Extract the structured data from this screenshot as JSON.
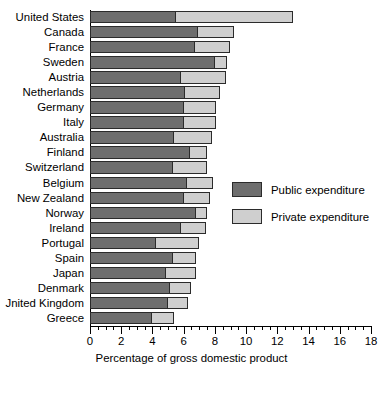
{
  "chart_data": {
    "type": "bar",
    "orientation": "horizontal",
    "stacked": true,
    "title": "",
    "xlabel": "Percentage of gross domestic product",
    "ylabel": "",
    "xlim": [
      0,
      18
    ],
    "xticks": [
      0,
      2,
      4,
      6,
      8,
      10,
      12,
      14,
      16,
      18
    ],
    "xtick_labels": [
      "0",
      "2",
      "4",
      "6",
      "8",
      "10",
      "12",
      "14",
      "16",
      "18"
    ],
    "minor_tick_step": 0.5,
    "grid": false,
    "legend_position": "center-right",
    "categories": [
      "United States",
      "Canada",
      "France",
      "Sweden",
      "Austria",
      "Netherlands",
      "Germany",
      "Italy",
      "Australia",
      "Finland",
      "Switzerland",
      "Belgium",
      "New Zealand",
      "Norway",
      "Ireland",
      "Portugal",
      "Spain",
      "Japan",
      "Denmark",
      "United Kingdom",
      "Greece"
    ],
    "series": [
      {
        "name": "Public expenditure",
        "color": "#6e6e6e",
        "values": [
          5.5,
          6.9,
          6.7,
          8.0,
          5.8,
          6.1,
          6.0,
          6.0,
          5.4,
          6.4,
          5.3,
          6.2,
          6.0,
          6.8,
          5.8,
          4.2,
          5.3,
          4.9,
          5.1,
          5.0,
          4.0
        ]
      },
      {
        "name": "Private expenditure",
        "color": "#cfcfcf",
        "values": [
          7.5,
          2.3,
          2.3,
          0.8,
          2.9,
          2.2,
          2.1,
          2.1,
          2.4,
          1.1,
          2.2,
          1.7,
          1.7,
          0.7,
          1.6,
          2.8,
          1.5,
          1.9,
          1.4,
          1.3,
          1.4
        ]
      }
    ],
    "totals": [
      13.0,
      9.2,
      9.0,
      8.8,
      8.7,
      8.3,
      8.1,
      8.1,
      7.8,
      7.5,
      7.5,
      7.9,
      7.7,
      7.5,
      7.4,
      7.0,
      6.8,
      6.8,
      6.5,
      6.3,
      5.4
    ],
    "display_categories": [
      "United States",
      "Canada",
      "France",
      "Sweden",
      "Austria",
      "Netherlands",
      "Germany",
      "Italy",
      "Australia",
      "Finland",
      "Switzerland",
      "Belgium",
      "New Zealand",
      "Norway",
      "Ireland",
      "Portugal",
      "Spain",
      "Japan",
      "Denmark",
      "Jnited Kingdom",
      "Greece"
    ]
  },
  "legend": {
    "items": [
      {
        "label": "Public expenditure",
        "color": "#6e6e6e"
      },
      {
        "label": "Private expenditure",
        "color": "#cfcfcf"
      }
    ]
  }
}
